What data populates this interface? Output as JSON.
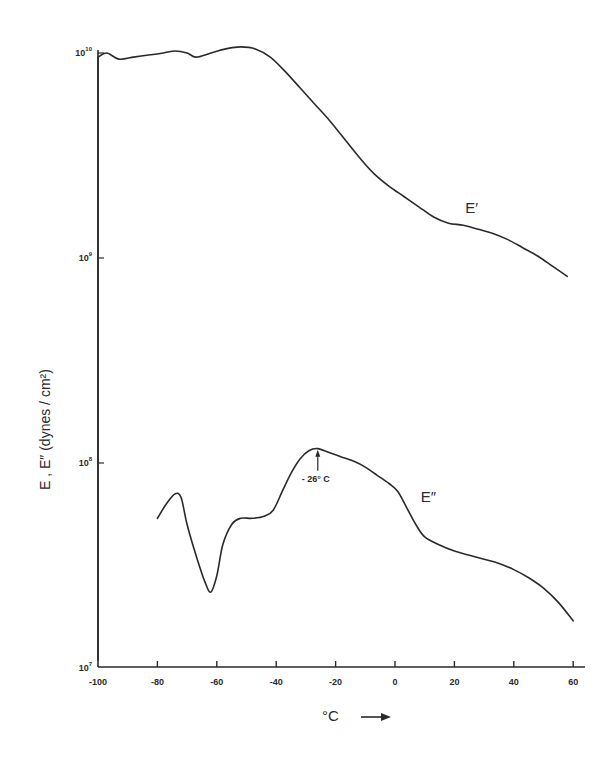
{
  "chart_data": {
    "type": "line",
    "title": "",
    "xlabel": "°C",
    "ylabel": "E', E'' (dynes / cm²)",
    "xlim": [
      -100,
      62
    ],
    "ylim": [
      10000000.0,
      10000000000.0
    ],
    "yscale": "log",
    "grid": false,
    "legend": "none (curves labeled inline)",
    "x_ticks": [
      -100,
      -80,
      -60,
      -40,
      -20,
      0,
      20,
      40,
      60
    ],
    "x_tick_labels": [
      "-100",
      "-80",
      "-60",
      "-40",
      "-20",
      "0",
      "20",
      "40",
      "60"
    ],
    "y_ticks": [
      10000000.0,
      100000000.0,
      1000000000.0,
      10000000000.0
    ],
    "y_tick_labels": [
      "10^7",
      "10^8",
      "10^9",
      "10^10"
    ],
    "series": [
      {
        "name": "E'",
        "x": [
          -100,
          -97,
          -93,
          -88,
          -83,
          -78,
          -74,
          -70,
          -67,
          -62,
          -57,
          -52,
          -47,
          -42,
          -37,
          -32,
          -27,
          -22,
          -17,
          -12,
          -7,
          -2,
          3,
          8,
          13,
          18,
          23,
          28,
          33,
          38,
          43,
          48,
          53,
          58
        ],
        "log10_y": [
          9.98,
          10.0,
          9.97,
          9.98,
          9.99,
          10.0,
          10.01,
          10.0,
          9.98,
          10.0,
          10.02,
          10.03,
          10.02,
          9.98,
          9.91,
          9.83,
          9.75,
          9.67,
          9.58,
          9.49,
          9.41,
          9.35,
          9.3,
          9.25,
          9.2,
          9.17,
          9.16,
          9.14,
          9.12,
          9.09,
          9.05,
          9.01,
          8.96,
          8.91
        ],
        "label_position": {
          "x": 27,
          "log10_y": 9.22
        }
      },
      {
        "name": "E''",
        "x": [
          -80,
          -77,
          -74,
          -72,
          -70,
          -67,
          -64,
          -62,
          -60,
          -58,
          -55,
          -52,
          -48,
          -44,
          -41,
          -38,
          -35,
          -32,
          -29,
          -26,
          -22,
          -18,
          -14,
          -10,
          -6,
          -2,
          1,
          4,
          7,
          10,
          15,
          20,
          25,
          30,
          35,
          40,
          45,
          50,
          55,
          60
        ],
        "log10_y": [
          7.73,
          7.8,
          7.85,
          7.83,
          7.7,
          7.55,
          7.42,
          7.37,
          7.45,
          7.6,
          7.7,
          7.73,
          7.73,
          7.74,
          7.77,
          7.86,
          7.95,
          8.02,
          8.06,
          8.07,
          8.05,
          8.03,
          8.01,
          7.98,
          7.94,
          7.9,
          7.86,
          7.78,
          7.7,
          7.64,
          7.6,
          7.57,
          7.55,
          7.53,
          7.51,
          7.48,
          7.44,
          7.39,
          7.32,
          7.23
        ],
        "label_position": {
          "x": 8,
          "log10_y": 7.83
        }
      }
    ],
    "annotations": [
      {
        "text": "-26° C",
        "x": -26,
        "log10_y": 8.07,
        "type": "arrow pointing to E'' peak"
      }
    ]
  },
  "labels": {
    "e_prime": "E′",
    "e_double_prime": "E″",
    "peak_annotation": "- 26° C",
    "x_axis_label": "°C",
    "y_axis_label": "E , E″  (dynes / cm²)"
  }
}
